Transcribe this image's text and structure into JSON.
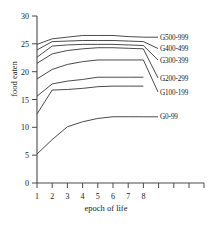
{
  "chart_data": {
    "type": "line",
    "title": "",
    "xlabel": "epoch of life",
    "ylabel": "food eaten",
    "x": [
      1,
      2,
      3,
      4,
      5,
      6,
      7,
      8
    ],
    "xlim": [
      1,
      12
    ],
    "ylim": [
      0,
      30
    ],
    "yticks": [
      0,
      5,
      10,
      15,
      20,
      25,
      30
    ],
    "xticks": [
      1,
      2,
      3,
      4,
      5,
      6,
      7,
      8
    ],
    "xtick_labels": [
      "1",
      "2",
      "3",
      "4",
      "5",
      "6",
      "7",
      "8"
    ],
    "ytick_labels": [
      "0",
      "5",
      "10",
      "15",
      "20",
      "25",
      "30"
    ],
    "grid": false,
    "legend_position": "right-inline",
    "series": [
      {
        "name": "G500-999",
        "values": [
          24.9,
          25.9,
          26.2,
          26.5,
          26.5,
          26.5,
          26.3,
          26.2
        ]
      },
      {
        "name": "G400-499",
        "values": [
          23.9,
          25.4,
          25.5,
          25.6,
          25.6,
          25.6,
          25.5,
          25.4
        ]
      },
      {
        "name": "G300-399",
        "values": [
          22.6,
          24.6,
          24.8,
          24.9,
          24.9,
          24.9,
          24.8,
          24.7
        ]
      },
      {
        "name": "G200-299",
        "values": [
          21.5,
          23.2,
          23.8,
          24.1,
          24.3,
          24.3,
          24.2,
          24.1
        ]
      },
      {
        "name": "G100-199",
        "values": [
          18.7,
          20.4,
          21.3,
          21.8,
          22.1,
          22.1,
          22.1,
          22.1
        ]
      },
      {
        "name": "G0-99",
        "values": [
          5.2,
          7.8,
          10.1,
          11.0,
          11.6,
          11.9,
          11.9,
          11.9
        ]
      }
    ],
    "extra_series": [
      {
        "name": "unlabeled-mid-upper",
        "values": [
          15.6,
          17.8,
          18.3,
          18.6,
          19.0,
          19.0,
          19.0,
          19.0
        ]
      },
      {
        "name": "unlabeled-mid-lower",
        "values": [
          12.4,
          16.7,
          16.8,
          17.0,
          17.3,
          17.4,
          17.4,
          17.4
        ]
      }
    ]
  },
  "labels": {
    "g500": "G500-999",
    "g400": "G400-499",
    "g300": "G300-399",
    "g200": "G200-299",
    "g100": "G100-199",
    "g0": "G0-99",
    "y0": "0",
    "y5": "5",
    "y10": "10",
    "y15": "15",
    "y20": "20",
    "y25": "25",
    "y30": "30",
    "x1": "1",
    "x2": "2",
    "x3": "3",
    "x4": "4",
    "x5": "5",
    "x6": "6",
    "x7": "7",
    "x8": "8",
    "axis_x_title": "epoch of life",
    "axis_y_title": "food eaten"
  }
}
